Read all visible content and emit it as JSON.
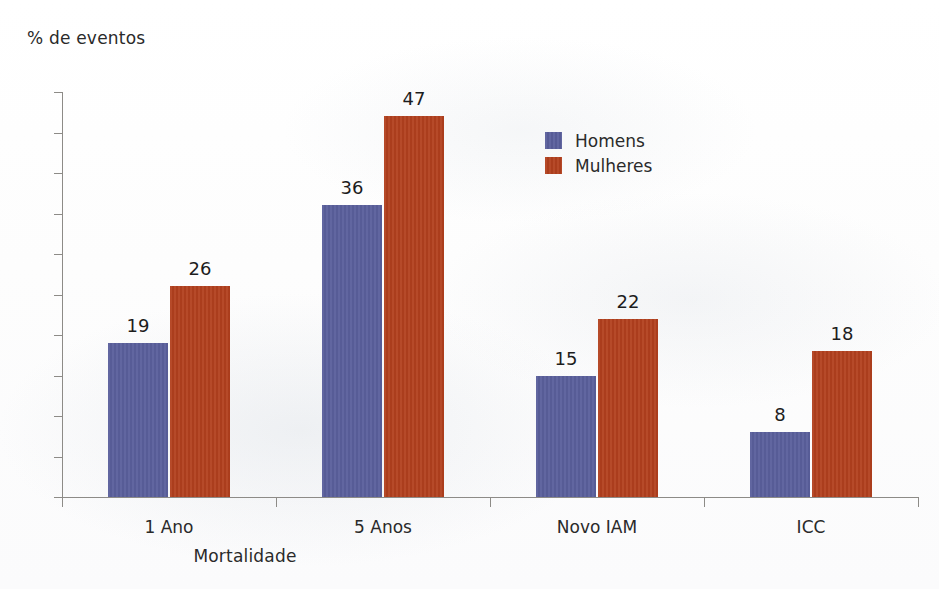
{
  "chart_data": {
    "type": "bar",
    "title": "",
    "subtitle": "",
    "xlabel": "Mortalidade",
    "ylabel": "% de eventos",
    "categories": [
      "1 Ano",
      "5 Anos",
      "Novo IAM",
      "ICC"
    ],
    "series": [
      {
        "name": "Homens",
        "color": "#5a5f9c",
        "values": [
          19,
          36,
          15,
          8
        ]
      },
      {
        "name": "Mulheres",
        "color": "#b2401e",
        "values": [
          26,
          47,
          22,
          18
        ]
      }
    ],
    "ylim": [
      0,
      50
    ],
    "ytick_step": 5,
    "yticks": [
      0,
      5,
      10,
      15,
      20,
      25,
      30,
      35,
      40,
      45,
      50
    ],
    "ytick_labels": [
      "0",
      "5",
      "10",
      "15",
      "20",
      "25",
      "30",
      "35",
      "40",
      "45",
      "50"
    ],
    "data_labels": [
      {
        "category": "1 Ano",
        "homens": "19",
        "mulheres": "26"
      },
      {
        "category": "5 Anos",
        "homens": "36",
        "mulheres": "47"
      },
      {
        "category": "Novo IAM",
        "homens": "15",
        "mulheres": "22"
      },
      {
        "category": "ICC",
        "homens": "8",
        "mulheres": "18"
      }
    ],
    "grid": false,
    "legend_position": "inside-top-right",
    "legend_entries": [
      "Homens",
      "Mulheres"
    ]
  },
  "axes": {
    "ylabel": "% de eventos",
    "xlabel": "Mortalidade"
  },
  "legend": {
    "homens": "Homens",
    "mulheres": "Mulheres"
  },
  "colors": {
    "homens": "#5a5f9c",
    "mulheres": "#b2401e",
    "axis": "#8d8b87",
    "text": "#2a2a2a",
    "background": "#fefefe"
  }
}
